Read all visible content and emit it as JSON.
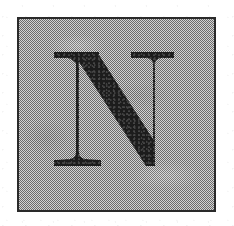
{
  "document": {
    "kind": "scanned-illustration",
    "description": "Square bordered plate containing a large serif capital letter",
    "page_background": "#ffffff"
  },
  "plate": {
    "name": "letter-plate",
    "fill_color": "#9d9d9d",
    "border_color": "#2a2a2a",
    "border_width_px": 2,
    "texture": "dithered-halftone",
    "left_px": 17,
    "top_px": 17,
    "width_px": 199,
    "height_px": 195
  },
  "glyph": {
    "character": "N",
    "name": "letter-n",
    "style": "serif-capital",
    "ink_color": "#1c1c1c",
    "left_px": 53,
    "top_px": 50,
    "width_px": 122,
    "height_px": 118
  }
}
